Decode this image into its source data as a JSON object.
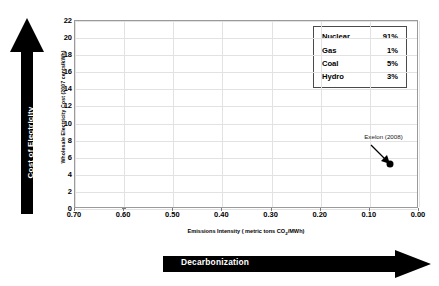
{
  "chart_data": {
    "type": "scatter",
    "title": "",
    "xlabel": "Emissions Intensity ( metric tons CO2/MWh)",
    "xlabel_prefix": "Emissions Intensity ( metric tons CO",
    "xlabel_sub": "2",
    "xlabel_suffix": "/MWh)",
    "ylabel": "Wholesale Electricity Cost (2007 cents/kWh)",
    "xlim": [
      0.7,
      0.0
    ],
    "ylim": [
      0,
      22
    ],
    "x_reversed": true,
    "xticks": [
      "0.70",
      "0.60",
      "0.50",
      "0.40",
      "0.30",
      "0.20",
      "0.10",
      "0.00"
    ],
    "xtick_values": [
      0.7,
      0.6,
      0.5,
      0.4,
      0.3,
      0.2,
      0.1,
      0.0
    ],
    "yticks": [
      "0",
      "2",
      "4",
      "6",
      "8",
      "10",
      "12",
      "14",
      "16",
      "18",
      "20",
      "22"
    ],
    "ytick_values": [
      0,
      2,
      4,
      6,
      8,
      10,
      12,
      14,
      16,
      18,
      20,
      22
    ],
    "grid": true,
    "legend_position": "top-right",
    "points": [
      {
        "label": "Exelon (2008)",
        "x": 0.06,
        "y": 5.3,
        "color": "#000000"
      }
    ],
    "series": [
      {
        "name": "Exelon (2008)",
        "x": [
          0.06
        ],
        "y": [
          5.3
        ]
      }
    ]
  },
  "legend": {
    "rows": [
      {
        "label": "Nuclear",
        "value": "91%"
      },
      {
        "label": "Gas",
        "value": "1%"
      },
      {
        "label": "Coal",
        "value": "5%"
      },
      {
        "label": "Hydro",
        "value": "3%"
      }
    ]
  },
  "annotations": {
    "vertical_arrow_label": "Cost of Electricity",
    "horizontal_arrow_label": "Decarbonization"
  },
  "colors": {
    "arrow": "#000000",
    "point": "#000000",
    "grid": "#e2e2e2",
    "frame": "#9a9a9a"
  }
}
